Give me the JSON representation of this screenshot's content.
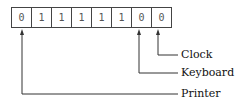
{
  "register": {
    "bits": [
      "0",
      "1",
      "1",
      "1",
      "1",
      "1",
      "0",
      "0"
    ]
  },
  "labels": {
    "clock": "Clock",
    "keyboard": "Keyboard",
    "printer": "Printer"
  },
  "colors": {
    "line": "#333333",
    "text": "#111111"
  }
}
